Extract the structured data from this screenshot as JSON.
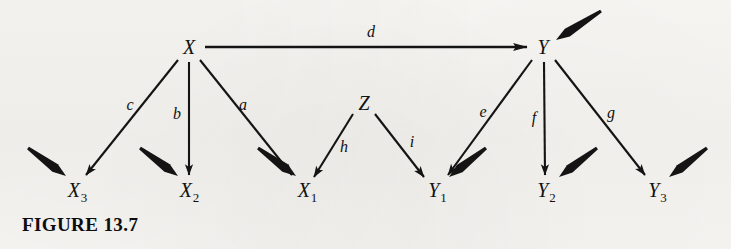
{
  "figure": {
    "caption": "FIGURE 13.7",
    "background_color": "#f6f5f2",
    "ink_color": "#111111",
    "width": 731,
    "height": 249
  },
  "diagram": {
    "type": "path-diagram",
    "nodes": [
      {
        "id": "X",
        "label": "X",
        "sub": "",
        "x": 189,
        "y": 47,
        "role": "latent-cause"
      },
      {
        "id": "Y",
        "label": "Y",
        "sub": "",
        "x": 543,
        "y": 47,
        "role": "latent-effect"
      },
      {
        "id": "Z",
        "label": "Z",
        "sub": "",
        "x": 364,
        "y": 103,
        "role": "latent-cause"
      },
      {
        "id": "X3",
        "label": "X",
        "sub": "3",
        "x": 77,
        "y": 190,
        "role": "indicator"
      },
      {
        "id": "X2",
        "label": "X",
        "sub": "2",
        "x": 189,
        "y": 190,
        "role": "indicator"
      },
      {
        "id": "X1",
        "label": "X",
        "sub": "1",
        "x": 307,
        "y": 190,
        "role": "indicator"
      },
      {
        "id": "Y1",
        "label": "Y",
        "sub": "1",
        "x": 437,
        "y": 190,
        "role": "indicator"
      },
      {
        "id": "Y2",
        "label": "Y",
        "sub": "2",
        "x": 546,
        "y": 190,
        "role": "indicator"
      },
      {
        "id": "Y3",
        "label": "Y",
        "sub": "3",
        "x": 657,
        "y": 190,
        "role": "indicator"
      }
    ],
    "edges": [
      {
        "id": "d",
        "label": "d",
        "from": "X",
        "to": "Y",
        "x1": 205,
        "y1": 47,
        "x2": 527,
        "y2": 47,
        "lx": 371,
        "ly": 32
      },
      {
        "id": "c",
        "label": "c",
        "from": "X",
        "to": "X3",
        "x1": 178,
        "y1": 60,
        "x2": 86,
        "y2": 175,
        "lx": 130,
        "ly": 105
      },
      {
        "id": "b",
        "label": "b",
        "from": "X",
        "to": "X2",
        "x1": 189,
        "y1": 62,
        "x2": 189,
        "y2": 175,
        "lx": 177,
        "ly": 114
      },
      {
        "id": "a",
        "label": "a",
        "from": "X",
        "to": "X1",
        "x1": 200,
        "y1": 60,
        "x2": 292,
        "y2": 175,
        "lx": 243,
        "ly": 105
      },
      {
        "id": "h",
        "label": "h",
        "from": "Z",
        "to": "X1",
        "x1": 353,
        "y1": 114,
        "x2": 314,
        "y2": 177,
        "lx": 344,
        "ly": 147
      },
      {
        "id": "i",
        "label": "i",
        "from": "Z",
        "to": "Y1",
        "x1": 375,
        "y1": 114,
        "x2": 424,
        "y2": 177,
        "lx": 412,
        "ly": 142
      },
      {
        "id": "e",
        "label": "e",
        "from": "Y",
        "to": "Y1",
        "x1": 532,
        "y1": 60,
        "x2": 448,
        "y2": 175,
        "lx": 483,
        "ly": 112
      },
      {
        "id": "f",
        "label": "f",
        "from": "Y",
        "to": "Y2",
        "x1": 544,
        "y1": 62,
        "x2": 545,
        "y2": 175,
        "lx": 534,
        "ly": 118
      },
      {
        "id": "g",
        "label": "g",
        "from": "Y",
        "to": "Y3",
        "x1": 555,
        "y1": 60,
        "x2": 645,
        "y2": 175,
        "lx": 611,
        "ly": 113
      }
    ],
    "disturbances": [
      {
        "id": "dist-Y",
        "to": "Y",
        "x1": 601,
        "y1": 11,
        "x2": 556,
        "y2": 40
      },
      {
        "id": "dist-X3a",
        "to": "X3",
        "x1": 28,
        "y1": 148,
        "x2": 66,
        "y2": 176
      },
      {
        "id": "dist-X2",
        "to": "X2",
        "x1": 140,
        "y1": 148,
        "x2": 178,
        "y2": 176
      },
      {
        "id": "dist-X1",
        "to": "X1",
        "x1": 258,
        "y1": 148,
        "x2": 296,
        "y2": 176
      },
      {
        "id": "dist-Y1",
        "to": "Y1",
        "x1": 486,
        "y1": 148,
        "x2": 449,
        "y2": 177
      },
      {
        "id": "dist-Y2",
        "to": "Y2",
        "x1": 597,
        "y1": 148,
        "x2": 559,
        "y2": 177
      },
      {
        "id": "dist-Y3",
        "to": "Y3",
        "x1": 707,
        "y1": 148,
        "x2": 669,
        "y2": 177
      }
    ]
  }
}
